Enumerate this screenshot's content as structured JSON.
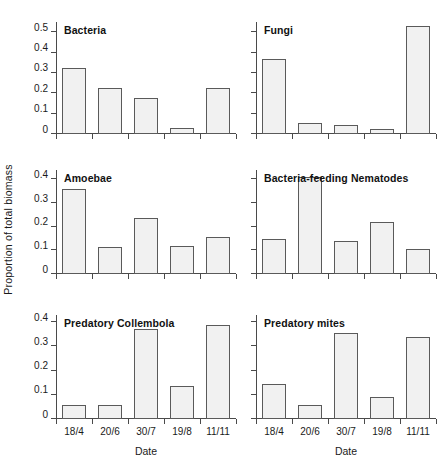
{
  "figure": {
    "ylabel": "Proportion of total biomass",
    "xlabel": "Date"
  },
  "chart_data": [
    {
      "type": "bar",
      "title": "Bacteria",
      "xlabel": "Date",
      "ylabel": "Proportion of total biomass",
      "categories": [
        "18/4",
        "20/6",
        "30/7",
        "19/8",
        "11/11"
      ],
      "values": [
        0.325,
        0.225,
        0.175,
        0.028,
        0.225
      ],
      "ylim": [
        0,
        0.55
      ],
      "yticks": [
        0,
        0.1,
        0.2,
        0.3,
        0.4,
        0.5
      ],
      "ytick_labels": [
        "0",
        "0.1",
        "0.2",
        "0.3",
        "0.4",
        "0.5"
      ],
      "show_ytick_labels": true,
      "show_xtick_labels": false,
      "show_xlabel": false,
      "grid": false,
      "legend": "none"
    },
    {
      "type": "bar",
      "title": "Fungi",
      "xlabel": "Date",
      "ylabel": "Proportion of total biomass",
      "categories": [
        "18/4",
        "20/6",
        "30/7",
        "19/8",
        "11/11"
      ],
      "values": [
        0.37,
        0.053,
        0.045,
        0.027,
        0.53
      ],
      "ylim": [
        0,
        0.55
      ],
      "yticks": [
        0,
        0.1,
        0.2,
        0.3,
        0.4,
        0.5
      ],
      "ytick_labels": [
        "",
        "",
        "",
        "",
        "",
        ""
      ],
      "show_ytick_labels": false,
      "show_xtick_labels": false,
      "show_xlabel": false,
      "grid": false,
      "legend": "none"
    },
    {
      "type": "bar",
      "title": "Amoebae",
      "xlabel": "Date",
      "ylabel": "Proportion of total biomass",
      "categories": [
        "18/4",
        "20/6",
        "30/7",
        "19/8",
        "11/11"
      ],
      "values": [
        0.358,
        0.115,
        0.235,
        0.117,
        0.155
      ],
      "ylim": [
        0,
        0.44
      ],
      "yticks": [
        0,
        0.1,
        0.2,
        0.3,
        0.4
      ],
      "ytick_labels": [
        "0",
        "0.1",
        "0.2",
        "0.3",
        "0.4"
      ],
      "show_ytick_labels": true,
      "show_xtick_labels": false,
      "show_xlabel": false,
      "grid": false,
      "legend": "none"
    },
    {
      "type": "bar",
      "title": "Bacteria-feeding Nematodes",
      "xlabel": "Date",
      "ylabel": "Proportion of total biomass",
      "categories": [
        "18/4",
        "20/6",
        "30/7",
        "19/8",
        "11/11"
      ],
      "values": [
        0.15,
        0.41,
        0.14,
        0.22,
        0.105
      ],
      "ylim": [
        0,
        0.44
      ],
      "yticks": [
        0,
        0.1,
        0.2,
        0.3,
        0.4
      ],
      "ytick_labels": [
        "",
        "",
        "",
        "",
        ""
      ],
      "show_ytick_labels": false,
      "show_xtick_labels": false,
      "show_xlabel": false,
      "grid": false,
      "legend": "none"
    },
    {
      "type": "bar",
      "title": "Predatory Collembola",
      "xlabel": "Date",
      "ylabel": "Proportion of total biomass",
      "categories": [
        "18/4",
        "20/6",
        "30/7",
        "19/8",
        "11/11"
      ],
      "values": [
        0.057,
        0.058,
        0.373,
        0.138,
        0.39
      ],
      "ylim": [
        0,
        0.43
      ],
      "yticks": [
        0,
        0.1,
        0.2,
        0.3,
        0.4
      ],
      "ytick_labels": [
        "0",
        "0.1",
        "0.2",
        "0.3",
        "0.4"
      ],
      "show_ytick_labels": true,
      "show_xtick_labels": true,
      "show_xlabel": true,
      "grid": false,
      "legend": "none"
    },
    {
      "type": "bar",
      "title": "Predatory mites",
      "xlabel": "Date",
      "ylabel": "Proportion of total biomass",
      "categories": [
        "18/4",
        "20/6",
        "30/7",
        "19/8",
        "11/11"
      ],
      "values": [
        0.145,
        0.058,
        0.355,
        0.092,
        0.338
      ],
      "ylim": [
        0,
        0.43
      ],
      "yticks": [
        0,
        0.1,
        0.2,
        0.3,
        0.4
      ],
      "ytick_labels": [
        "",
        "",
        "",
        "",
        ""
      ],
      "show_ytick_labels": false,
      "show_xtick_labels": true,
      "show_xlabel": true,
      "grid": false,
      "legend": "none"
    }
  ]
}
